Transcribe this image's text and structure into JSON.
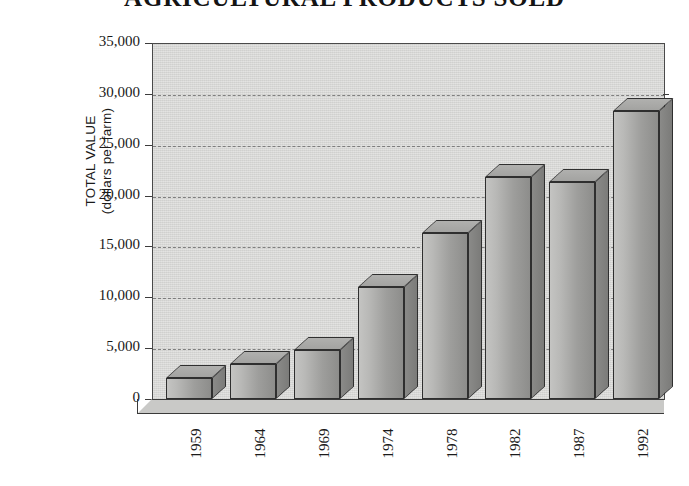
{
  "chart_data": {
    "type": "bar",
    "title": "AGRICULTURAL PRODUCTS SOLD",
    "xlabel": "",
    "ylabel_line1": "TOTAL VALUE",
    "ylabel_line2": "(dollars per farm)",
    "categories": [
      "1959",
      "1964",
      "1969",
      "1974",
      "1978",
      "1982",
      "1987",
      "1992"
    ],
    "values": [
      2100,
      3400,
      4800,
      11000,
      16300,
      21800,
      21300,
      28300
    ],
    "ylim": [
      0,
      35000
    ],
    "ytick_values": [
      0,
      5000,
      10000,
      15000,
      20000,
      25000,
      30000,
      35000
    ],
    "ytick_labels": [
      "0",
      "5,000",
      "10,000",
      "15,000",
      "20,000",
      "25,000",
      "30,000",
      "35,000"
    ],
    "grid": true,
    "grid_style": "dashed-horizontal",
    "legend": null,
    "style_3d": true
  },
  "colors": {
    "plot_background": "#d7d7d5",
    "bar_front": "#b3b3b1",
    "bar_side": "#828280",
    "bar_top": "#a9a9a7",
    "axis_line": "#3a3a3a",
    "gridline": "#6f6f6f",
    "text": "#1a1a1a",
    "page_background": "#ffffff"
  }
}
